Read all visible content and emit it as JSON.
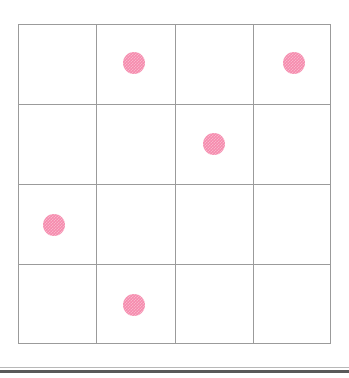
{
  "canvas": {
    "width": 349,
    "height": 378,
    "background": "#ffffff"
  },
  "grid": {
    "label": "4 by 4 grid",
    "rows": 4,
    "columns": 4,
    "origin_x": 18,
    "origin_y": 24,
    "width": 313,
    "height": 320,
    "cell_width": 78.25,
    "cell_height": 80,
    "line_color": "#9b9b9b",
    "line_width": 1,
    "vertical_line_x": [
      0,
      78.25,
      156.5,
      234.75,
      312
    ],
    "horizontal_line_y": [
      0,
      80,
      160,
      240,
      319
    ]
  },
  "dots": {
    "count": 5,
    "color": "#f58aad",
    "diameter": 22,
    "texture": "checkered-dither",
    "items": [
      {
        "name": "dot-r1c2",
        "row": 1,
        "column": 2,
        "cx": 134,
        "cy": 63
      },
      {
        "name": "dot-r1c4",
        "row": 1,
        "column": 4,
        "cx": 294,
        "cy": 63
      },
      {
        "name": "dot-r2c3",
        "row": 2,
        "column": 3,
        "cx": 214,
        "cy": 144
      },
      {
        "name": "dot-r3c1",
        "row": 3,
        "column": 1,
        "cx": 54,
        "cy": 225
      },
      {
        "name": "dot-r4c2",
        "row": 4,
        "column": 2,
        "cx": 134,
        "cy": 305
      }
    ]
  },
  "bottom_rule": {
    "y": 370,
    "height": 3,
    "color": "#595959",
    "soft_y": 367,
    "soft_color": "#b8b8b8"
  }
}
